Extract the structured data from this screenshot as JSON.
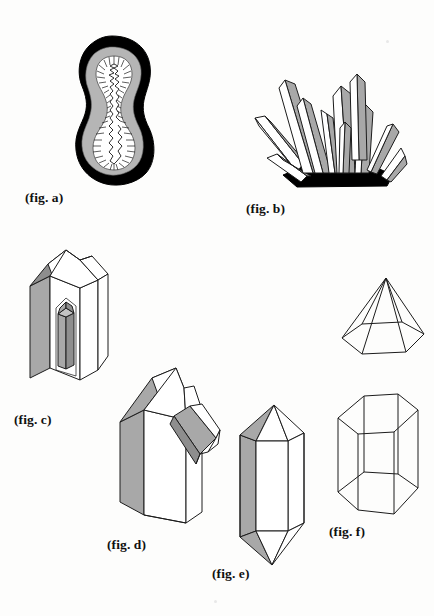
{
  "plate": {
    "title": "Crystal and geode illustration plate",
    "background_color": "#fdfdfc",
    "width": 434,
    "height": 616
  },
  "palette": {
    "ink": "#1c1c1c",
    "black_fill": "#000000",
    "gray_mid": "#a8a8a8",
    "gray_light": "#c3c3c3",
    "gray_dark": "#8e8e8e",
    "white_fill": "#ffffff"
  },
  "figures": [
    {
      "id": "a",
      "caption": "(fig. a)",
      "name": "geode-cross-section",
      "description": "Peanut-shaped geode cut in half showing thick black outer rind, gray banded layer, and hollow white cavity lined with inward-pointing crystal spikes",
      "shading": "black rind, gray band, white cavity"
    },
    {
      "id": "b",
      "caption": "(fig. b)",
      "name": "crystal-cluster",
      "description": "Radiating cluster of pointed prismatic crystals growing from a dark matrix base",
      "shading": "gray and white faces on black base"
    },
    {
      "id": "c",
      "caption": "(fig. c)",
      "name": "phantom-crystal",
      "description": "Hexagonal prism crystal with pointed termination containing a smaller gray phantom crystal visible inside",
      "shading": "gray left face, white front faces, gray inner crystal"
    },
    {
      "id": "d",
      "caption": "(fig. d)",
      "name": "crystal-with-parasite",
      "description": "Large prismatic crystal with a smaller secondary crystal attached diagonally on its right face",
      "shading": "gray left face, white front face"
    },
    {
      "id": "e",
      "caption": "(fig. e)",
      "name": "doubly-terminated-crystal",
      "description": "Hexagonal prism terminated with pyramidal points at both the top and the bottom",
      "shading": "gray left faces, white front faces"
    },
    {
      "id": "f",
      "caption": "(fig. f)",
      "name": "hexagonal-prism-wireframe",
      "description": "Transparent outline hexagonal prism drawn as a wireframe with no shading"
    },
    {
      "id": "pyramid",
      "caption": "",
      "name": "hexagonal-pyramid-wireframe",
      "description": "Transparent outline hexagonal pyramid drawn as a wireframe above fig. f"
    }
  ]
}
